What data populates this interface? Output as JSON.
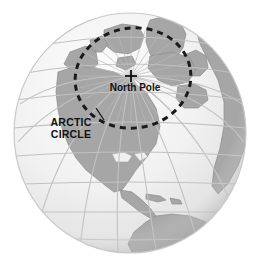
{
  "figure": {
    "kind": "globe-illustration",
    "background_color": "#ffffff"
  },
  "globe": {
    "center_x": 130,
    "center_y": 133,
    "radius_x": 116,
    "radius_y": 120,
    "ocean_color": "#f2f2f2",
    "ocean_highlight_color": "#fbfbfb",
    "ocean_shadow_color": "#d2d2d2",
    "land_color": "#a6a6a6",
    "land_outline_color": "#8f8f8f",
    "outline_color": "#c9c9c9",
    "graticule_color": "#c0c0c0",
    "graticule_width": 1.1
  },
  "markers": {
    "north_pole": {
      "symbol": "+",
      "label": "North Pole",
      "marker_x": 131,
      "marker_y": 76,
      "label_x": 135,
      "label_y": 89,
      "color": "#111111"
    },
    "arctic_circle": {
      "label_line_1": "ARCTIC",
      "label_line_2": "CIRCLE",
      "label_x": 71,
      "label_y_1": 124,
      "label_y_2": 136,
      "leader_from_x": 103,
      "leader_from_y": 120,
      "leader_to_x": 95,
      "leader_to_y": 108,
      "color": "#111111"
    }
  },
  "arctic_circle_ring": {
    "center_x": 133,
    "center_y": 78,
    "radius_x": 58,
    "radius_y": 50,
    "rotation_deg": -8,
    "dash_pattern": "6 5",
    "stroke_width": 3,
    "stroke_color": "#1a1a1a"
  },
  "polar_rays": {
    "count": 24,
    "origin_x": 131,
    "origin_y": 76,
    "length": 56,
    "color": "#b9b9b9",
    "stroke_width": 0.7
  },
  "landmasses": [
    {
      "name": "greenland"
    },
    {
      "name": "northern-canada-archipelago"
    },
    {
      "name": "alaska"
    },
    {
      "name": "north-america"
    },
    {
      "name": "central-america"
    },
    {
      "name": "south-america"
    },
    {
      "name": "eurasia"
    },
    {
      "name": "scandinavia"
    },
    {
      "name": "iceland"
    },
    {
      "name": "caribbean-islands"
    },
    {
      "name": "great-lakes"
    }
  ],
  "graticule": {
    "meridian_count": 9,
    "parallel_count": 9,
    "meridian_spacing_deg": 20,
    "parallel_spacing_deg": 20
  }
}
